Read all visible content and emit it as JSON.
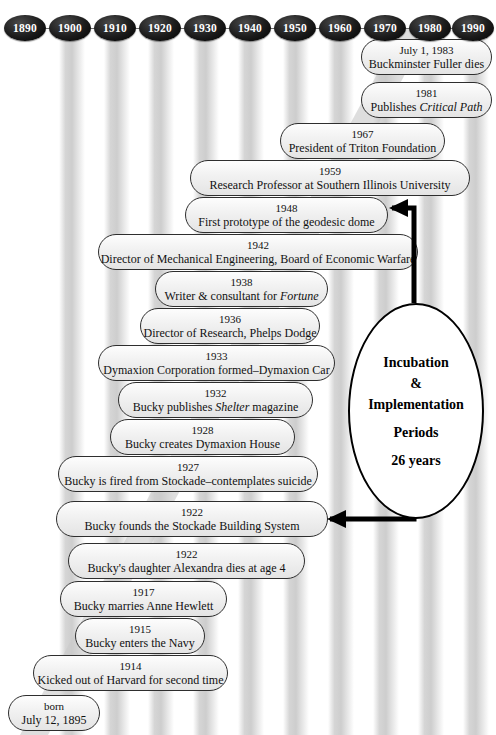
{
  "axis": {
    "decades": [
      "1890",
      "1900",
      "1910",
      "1920",
      "1930",
      "1940",
      "1950",
      "1960",
      "1970",
      "1980",
      "1990"
    ]
  },
  "callout": {
    "line1": "Incubation",
    "line2": "&",
    "line3": "Implementation",
    "line4": "Periods",
    "line5": "26 years"
  },
  "events": [
    {
      "year": "July 1, 1983",
      "desc": "Buckminster Fuller dies"
    },
    {
      "year": "1981",
      "desc": "Publishes ",
      "italic": "Critical Path",
      "desc_after": ""
    },
    {
      "year": "1967",
      "desc": "President of Triton Foundation"
    },
    {
      "year": "1959",
      "desc": "Research Professor at Southern Illinois University"
    },
    {
      "year": "1948",
      "desc": "First prototype of the geodesic dome"
    },
    {
      "year": "1942",
      "desc": "Director of Mechanical Engineering, Board of Economic Warfare"
    },
    {
      "year": "1938",
      "desc": "Writer & consultant for ",
      "italic": "Fortune",
      "desc_after": ""
    },
    {
      "year": "1936",
      "desc": "Director of Research, Phelps Dodge"
    },
    {
      "year": "1933",
      "desc": "Dymaxion Corporation formed–Dymaxion Car"
    },
    {
      "year": "1932",
      "desc": "Bucky publishes ",
      "italic": "Shelter",
      "desc_after": " magazine"
    },
    {
      "year": "1928",
      "desc": "Bucky creates Dymaxion House"
    },
    {
      "year": "1927",
      "desc": "Bucky is fired from Stockade–contemplates suicide"
    },
    {
      "year": "1922",
      "desc": "Bucky founds the Stockade Building System"
    },
    {
      "year": "1922",
      "desc": "Bucky's daughter Alexandra dies at age 4"
    },
    {
      "year": "1917",
      "desc": "Bucky marries Anne Hewlett"
    },
    {
      "year": "1915",
      "desc": "Bucky enters the Navy"
    },
    {
      "year": "1914",
      "desc": "Kicked out of Harvard for second time"
    },
    {
      "year": "born",
      "desc": "July 12, 1895"
    }
  ],
  "colors": {
    "marker_fill": "#000000",
    "marker_text": "#ffffff",
    "capsule_border": "#2e2e2e",
    "capsule_fill": "#f0f0f0",
    "connector": "#000000",
    "band": "#cecece"
  }
}
